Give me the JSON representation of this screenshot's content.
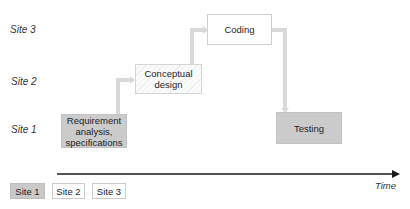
{
  "y_axis": {
    "labels": [
      "Site 3",
      "Site 2",
      "Site 1"
    ]
  },
  "phases": [
    {
      "id": "requirement",
      "label": "Requirement analysis, specifications",
      "site": "Site 1"
    },
    {
      "id": "conceptual",
      "label": "Conceptual design",
      "site": "Site 2"
    },
    {
      "id": "coding",
      "label": "Coding",
      "site": "Site 3"
    },
    {
      "id": "testing",
      "label": "Testing",
      "site": "Site 1"
    }
  ],
  "time_axis": {
    "label": "Time"
  },
  "legend": {
    "items": [
      "Site 1",
      "Site 2",
      "Site 3"
    ]
  },
  "colors": {
    "site1": "#cbcbcb",
    "site2": "#f5f5f5",
    "site3": "#ffffff",
    "connector": "#d6d6d6",
    "axis": "#1a1a1a"
  }
}
